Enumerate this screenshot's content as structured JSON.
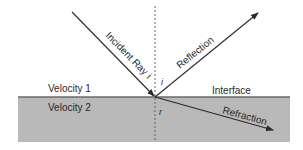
{
  "diagram": {
    "type": "reflection-refraction",
    "labels": {
      "velocity1": "Velocity 1",
      "velocity2": "Velocity 2",
      "interface": "Interface",
      "incident": "Incident Ray",
      "incident_angle_on_ray": "i",
      "incident_angle": "i",
      "reflection": "Reflection",
      "refraction": "Refraction",
      "refraction_angle": "r"
    },
    "colors": {
      "medium2_fill": "#b8b8b8",
      "line": "#2a2a2a",
      "interface_line": "#6e6e6e",
      "background": "#ffffff"
    },
    "geometry": {
      "interface_y": 97,
      "normal_x": 155,
      "medium2_rect": {
        "x": 18,
        "y": 97,
        "width": 272,
        "height": 45
      }
    }
  }
}
